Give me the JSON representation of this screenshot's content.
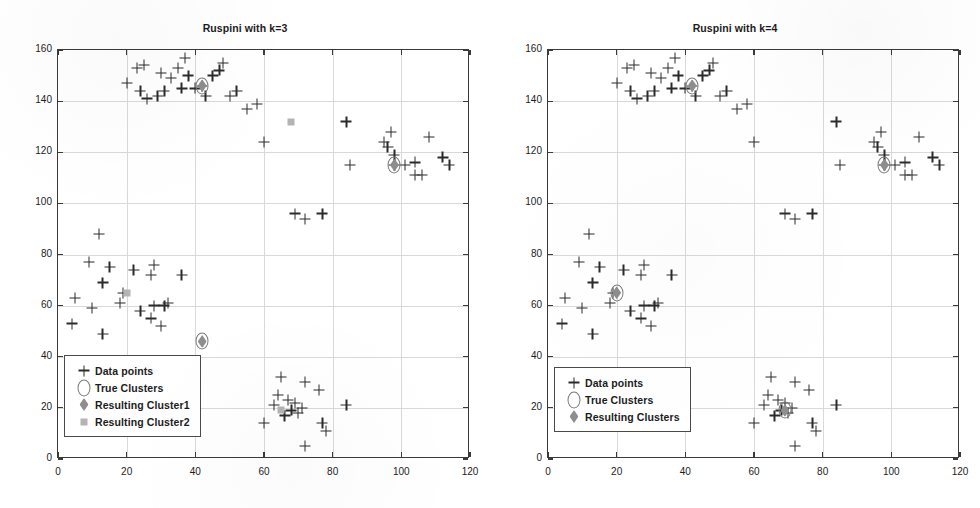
{
  "figure": {
    "width": 980,
    "height": 508,
    "background": "#ffffff"
  },
  "chart_data": [
    {
      "type": "scatter",
      "title": "Ruspini with k=3",
      "xlabel": "",
      "ylabel": "",
      "xlim": [
        0,
        120
      ],
      "ylim": [
        0,
        160
      ],
      "xticks": [
        0,
        20,
        40,
        60,
        80,
        100,
        120
      ],
      "yticks": [
        0,
        20,
        40,
        60,
        80,
        100,
        120,
        140,
        160
      ],
      "grid": true,
      "legend_position": "lower-left",
      "legend": [
        {
          "label": "Data points",
          "marker": "plus",
          "color": "#2b2b2b"
        },
        {
          "label": "True Clusters",
          "marker": "circle",
          "color": "#7a7a7a"
        },
        {
          "label": "Resulting Cluster1",
          "marker": "diamond",
          "color": "#8e8e8e"
        },
        {
          "label": "Resulting Cluster2",
          "marker": "square",
          "color": "#b4b4b4"
        }
      ],
      "series": [
        {
          "name": "Data points",
          "marker": "plus",
          "points": [
            [
              4,
              53
            ],
            [
              5,
              63
            ],
            [
              10,
              59
            ],
            [
              9,
              77
            ],
            [
              13,
              49
            ],
            [
              13,
              69
            ],
            [
              12,
              88
            ],
            [
              15,
              75
            ],
            [
              18,
              61
            ],
            [
              19,
              65
            ],
            [
              22,
              74
            ],
            [
              27,
              72
            ],
            [
              28,
              76
            ],
            [
              24,
              58
            ],
            [
              27,
              55
            ],
            [
              28,
              60
            ],
            [
              30,
              52
            ],
            [
              31,
              60
            ],
            [
              32,
              61
            ],
            [
              36,
              72
            ],
            [
              20,
              147
            ],
            [
              23,
              153
            ],
            [
              25,
              154
            ],
            [
              24,
              144
            ],
            [
              26,
              141
            ],
            [
              29,
              142
            ],
            [
              30,
              151
            ],
            [
              31,
              144
            ],
            [
              33,
              149
            ],
            [
              35,
              153
            ],
            [
              36,
              145
            ],
            [
              37,
              157
            ],
            [
              38,
              150
            ],
            [
              40,
              145
            ],
            [
              42,
              146
            ],
            [
              43,
              142
            ],
            [
              45,
              150
            ],
            [
              47,
              152
            ],
            [
              48,
              155
            ],
            [
              50,
              142
            ],
            [
              52,
              144
            ],
            [
              55,
              137
            ],
            [
              58,
              139
            ],
            [
              60,
              124
            ],
            [
              69,
              96
            ],
            [
              72,
              94
            ],
            [
              77,
              96
            ],
            [
              84,
              132
            ],
            [
              85,
              115
            ],
            [
              95,
              124
            ],
            [
              96,
              122
            ],
            [
              97,
              128
            ],
            [
              98,
              119
            ],
            [
              98,
              115
            ],
            [
              101,
              115
            ],
            [
              104,
              116
            ],
            [
              104,
              111
            ],
            [
              106,
              111
            ],
            [
              108,
              126
            ],
            [
              112,
              118
            ],
            [
              114,
              115
            ],
            [
              60,
              14
            ],
            [
              63,
              21
            ],
            [
              64,
              25
            ],
            [
              65,
              32
            ],
            [
              66,
              17
            ],
            [
              67,
              23
            ],
            [
              68,
              19
            ],
            [
              69,
              22
            ],
            [
              70,
              18
            ],
            [
              71,
              20
            ],
            [
              72,
              30
            ],
            [
              72,
              5
            ],
            [
              76,
              27
            ],
            [
              77,
              14
            ],
            [
              78,
              11
            ],
            [
              84,
              21
            ]
          ]
        },
        {
          "name": "True Clusters",
          "marker": "circle",
          "points": [
            [
              42,
              146
            ],
            [
              98,
              115
            ],
            [
              42,
              46
            ]
          ]
        },
        {
          "name": "Resulting Cluster1",
          "marker": "diamond",
          "points": [
            [
              42,
              146
            ],
            [
              98,
              115
            ],
            [
              42,
              46
            ]
          ]
        },
        {
          "name": "Resulting Cluster2",
          "marker": "square",
          "points": [
            [
              20,
              65
            ],
            [
              65,
              19
            ],
            [
              68,
              132
            ]
          ]
        }
      ]
    },
    {
      "type": "scatter",
      "title": "Ruspini with k=4",
      "xlabel": "",
      "ylabel": "",
      "xlim": [
        0,
        120
      ],
      "ylim": [
        0,
        160
      ],
      "xticks": [
        0,
        20,
        40,
        60,
        80,
        100,
        120
      ],
      "yticks": [
        0,
        20,
        40,
        60,
        80,
        100,
        120,
        140,
        160
      ],
      "grid": true,
      "legend_position": "lower-left",
      "legend": [
        {
          "label": "Data points",
          "marker": "plus",
          "color": "#2b2b2b"
        },
        {
          "label": "True Clusters",
          "marker": "circle",
          "color": "#7a7a7a"
        },
        {
          "label": "Resulting Clusters",
          "marker": "diamond",
          "color": "#8e8e8e"
        }
      ],
      "series": [
        {
          "name": "Data points",
          "marker": "plus",
          "points": [
            [
              4,
              53
            ],
            [
              5,
              63
            ],
            [
              10,
              59
            ],
            [
              9,
              77
            ],
            [
              13,
              49
            ],
            [
              13,
              69
            ],
            [
              12,
              88
            ],
            [
              15,
              75
            ],
            [
              18,
              61
            ],
            [
              19,
              65
            ],
            [
              22,
              74
            ],
            [
              27,
              72
            ],
            [
              28,
              76
            ],
            [
              24,
              58
            ],
            [
              27,
              55
            ],
            [
              28,
              60
            ],
            [
              30,
              52
            ],
            [
              31,
              60
            ],
            [
              32,
              61
            ],
            [
              36,
              72
            ],
            [
              20,
              147
            ],
            [
              23,
              153
            ],
            [
              25,
              154
            ],
            [
              24,
              144
            ],
            [
              26,
              141
            ],
            [
              29,
              142
            ],
            [
              30,
              151
            ],
            [
              31,
              144
            ],
            [
              33,
              149
            ],
            [
              35,
              153
            ],
            [
              36,
              145
            ],
            [
              37,
              157
            ],
            [
              38,
              150
            ],
            [
              40,
              145
            ],
            [
              42,
              146
            ],
            [
              43,
              142
            ],
            [
              45,
              150
            ],
            [
              47,
              152
            ],
            [
              48,
              155
            ],
            [
              50,
              142
            ],
            [
              52,
              144
            ],
            [
              55,
              137
            ],
            [
              58,
              139
            ],
            [
              60,
              124
            ],
            [
              69,
              96
            ],
            [
              72,
              94
            ],
            [
              77,
              96
            ],
            [
              84,
              132
            ],
            [
              85,
              115
            ],
            [
              95,
              124
            ],
            [
              96,
              122
            ],
            [
              97,
              128
            ],
            [
              98,
              119
            ],
            [
              98,
              115
            ],
            [
              101,
              115
            ],
            [
              104,
              116
            ],
            [
              104,
              111
            ],
            [
              106,
              111
            ],
            [
              108,
              126
            ],
            [
              112,
              118
            ],
            [
              114,
              115
            ],
            [
              60,
              14
            ],
            [
              63,
              21
            ],
            [
              64,
              25
            ],
            [
              65,
              32
            ],
            [
              66,
              17
            ],
            [
              67,
              23
            ],
            [
              68,
              19
            ],
            [
              69,
              22
            ],
            [
              70,
              18
            ],
            [
              71,
              20
            ],
            [
              72,
              30
            ],
            [
              72,
              5
            ],
            [
              76,
              27
            ],
            [
              77,
              14
            ],
            [
              78,
              11
            ],
            [
              84,
              21
            ]
          ]
        },
        {
          "name": "True Clusters",
          "marker": "circle",
          "points": [
            [
              42,
              146
            ],
            [
              98,
              115
            ],
            [
              20,
              65
            ],
            [
              69,
              19
            ]
          ]
        },
        {
          "name": "Resulting Clusters",
          "marker": "diamond",
          "points": [
            [
              42,
              146
            ],
            [
              98,
              115
            ],
            [
              20,
              65
            ],
            [
              69,
              19
            ]
          ]
        }
      ]
    }
  ]
}
